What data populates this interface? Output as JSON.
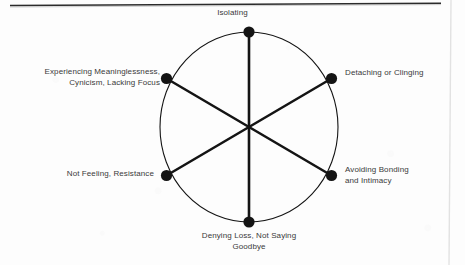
{
  "diagram": {
    "type": "radial-wheel",
    "title": "",
    "geometry": {
      "center_x": 249,
      "center_y": 127,
      "radius_x": 89,
      "radius_y": 95,
      "node_count": 6,
      "node_radius": 5.5,
      "stroke_color": "#141414",
      "circle_stroke_width": 1.1,
      "spoke_stroke_width": 2.6
    },
    "nodes": [
      {
        "id": "isolating",
        "label": "Isolating",
        "angle_deg": 90,
        "position": "top"
      },
      {
        "id": "detaching",
        "label": "Detaching or Clinging",
        "angle_deg": 30,
        "position": "upper-right"
      },
      {
        "id": "avoiding",
        "label": "Avoiding Bonding\nand Intimacy",
        "angle_deg": -30,
        "position": "lower-right"
      },
      {
        "id": "denying",
        "label": "Denying Loss, Not Saying\nGoodbye",
        "angle_deg": -90,
        "position": "bottom"
      },
      {
        "id": "not-feeling",
        "label": "Not Feeling, Resistance",
        "angle_deg": -150,
        "position": "lower-left"
      },
      {
        "id": "meaninglessness",
        "label": "Experiencing Meaninglessness,\nCynicism, Lacking Focus",
        "angle_deg": 150,
        "position": "upper-left"
      }
    ],
    "spokes": [
      {
        "from": "isolating",
        "to": "denying"
      },
      {
        "from": "detaching",
        "to": "not-feeling"
      },
      {
        "from": "avoiding",
        "to": "meaninglessness"
      }
    ],
    "artifacts": {
      "top_rule_color": "#2b2b2b",
      "page_edge_color": "#e2e2e2",
      "background_color": "#fdfdfd",
      "text_color": "#3a3a3a"
    }
  }
}
